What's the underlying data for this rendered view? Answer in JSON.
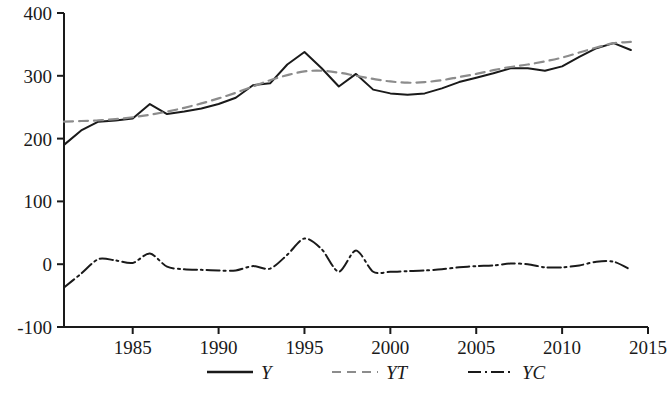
{
  "chart_data": {
    "type": "line",
    "title": "",
    "xlabel": "",
    "ylabel": "",
    "xlim": [
      1981,
      2015
    ],
    "ylim": [
      -100,
      400
    ],
    "grid": false,
    "legend_position": "bottom-center",
    "xticks": [
      1985,
      1990,
      1995,
      2000,
      2005,
      2010,
      2015
    ],
    "xtick_labels": [
      "1985",
      "1990",
      "1995",
      "2000",
      "2005",
      "2010",
      "2015"
    ],
    "yticks": [
      -100,
      0,
      100,
      200,
      300,
      400
    ],
    "ytick_labels": [
      "-100",
      "0",
      "100",
      "200",
      "300",
      "400"
    ],
    "x": [
      1981,
      1982,
      1983,
      1984,
      1985,
      1986,
      1987,
      1988,
      1989,
      1990,
      1991,
      1992,
      1993,
      1994,
      1995,
      1996,
      1997,
      1998,
      1999,
      2000,
      2001,
      2002,
      2003,
      2004,
      2005,
      2006,
      2007,
      2008,
      2009,
      2010,
      2011,
      2012,
      2013,
      2014
    ],
    "series": [
      {
        "name": "Y",
        "style": "solid",
        "color": "#1a1a1a",
        "values": [
          190,
          213,
          227,
          229,
          232,
          255,
          239,
          243,
          248,
          255,
          265,
          285,
          288,
          318,
          338,
          312,
          283,
          303,
          278,
          272,
          270,
          272,
          280,
          290,
          297,
          304,
          312,
          312,
          308,
          315,
          330,
          344,
          352,
          341
        ]
      },
      {
        "name": "YT",
        "style": "dashed",
        "color": "#8c8c8c",
        "values": [
          227,
          228,
          229,
          231,
          234,
          238,
          243,
          249,
          256,
          264,
          273,
          283,
          293,
          301,
          307,
          308,
          305,
          300,
          295,
          291,
          289,
          290,
          293,
          298,
          303,
          309,
          314,
          318,
          323,
          329,
          337,
          345,
          352,
          354
        ]
      },
      {
        "name": "YC",
        "style": "dashdot",
        "color": "#1a1a1a",
        "values": [
          -37,
          -15,
          8,
          6,
          2,
          17,
          -4,
          -8,
          -9,
          -10,
          -10,
          -3,
          -7,
          15,
          41,
          24,
          -12,
          22,
          -12,
          -12,
          -11,
          -10,
          -8,
          -5,
          -3,
          -2,
          1,
          0,
          -5,
          -5,
          -2,
          4,
          4,
          -9
        ]
      }
    ]
  },
  "legend": {
    "items": [
      {
        "label": "Y",
        "style": "solid"
      },
      {
        "label": "YT",
        "style": "dashed"
      },
      {
        "label": "YC",
        "style": "dashdot"
      }
    ]
  },
  "axes": {
    "y_axis_name": "y-axis",
    "x_axis_name": "x-axis"
  }
}
